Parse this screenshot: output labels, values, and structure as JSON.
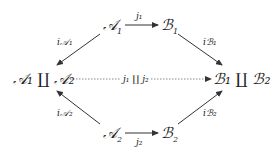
{
  "nodes": {
    "a1": {
      "main": "𝒜",
      "sub": "1"
    },
    "b1": {
      "main": "ℬ",
      "sub": "1"
    },
    "a2": {
      "main": "𝒜",
      "sub": "2"
    },
    "b2": {
      "main": "ℬ",
      "sub": "2"
    },
    "coprodA": "𝒜₁ ∐ 𝒜₂",
    "coprodB": "ℬ₁ ∐ ℬ₂"
  },
  "labels": {
    "j1": "j₁",
    "j2": "j₂",
    "iA1": "i𝒜₁",
    "iB1": "iℬ₁",
    "iA2": "i𝒜₂",
    "iB2": "iℬ₂",
    "j1j2": "j₁ ∐ j₂"
  }
}
